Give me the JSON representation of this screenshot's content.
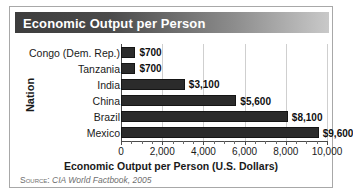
{
  "figure": {
    "title": "Economic Output per Person",
    "source_label": "Source:",
    "source_text": "CIA World Factbook, 2005"
  },
  "chart_data": {
    "type": "bar",
    "orientation": "horizontal",
    "title": "Economic Output per Person",
    "xlabel": "Economic Output per Person (U.S. Dollars)",
    "ylabel": "Nation",
    "xlim": [
      0,
      10000
    ],
    "grid": true,
    "legend": "none",
    "xticks": [
      0,
      2000,
      4000,
      6000,
      8000,
      10000
    ],
    "xtick_labels": [
      "0",
      "2,000",
      "4,000",
      "6,000",
      "8,000",
      "10,000"
    ],
    "minor_tick_interval": 500,
    "categories": [
      "Congo (Dem. Rep.)",
      "Tanzania",
      "India",
      "China",
      "Brazil",
      "Mexico"
    ],
    "values": [
      700,
      700,
      3100,
      5600,
      8100,
      9600
    ],
    "value_labels": [
      "$700",
      "$700",
      "$3,100",
      "$5,600",
      "$8,100",
      "$9,600"
    ],
    "bar_color": "#2b2b2b",
    "grid_color": "#cfcfcf",
    "axis_color": "#4a4a4a"
  }
}
